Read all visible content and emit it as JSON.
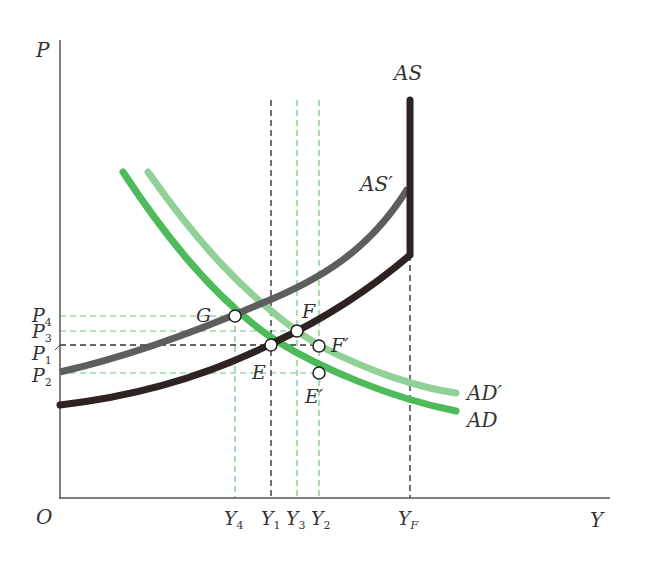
{
  "diagram": {
    "axes": {
      "y_label": "P",
      "x_label": "Y",
      "origin_label": "O"
    },
    "price_levels": [
      {
        "id": "P4",
        "base": "P",
        "sub": "4"
      },
      {
        "id": "P3",
        "base": "P",
        "sub": "3"
      },
      {
        "id": "P1",
        "base": "P",
        "sub": "1"
      },
      {
        "id": "P2",
        "base": "P",
        "sub": "2"
      }
    ],
    "output_levels": [
      {
        "id": "Y4",
        "base": "Y",
        "sub": "4"
      },
      {
        "id": "Y1",
        "base": "Y",
        "sub": "1"
      },
      {
        "id": "Y3",
        "base": "Y",
        "sub": "3"
      },
      {
        "id": "Y2",
        "base": "Y",
        "sub": "2"
      },
      {
        "id": "YF",
        "base": "Y",
        "sub": "F"
      }
    ],
    "curves": {
      "AS": {
        "label": "AS",
        "color": "#2e2222"
      },
      "AS_prime": {
        "label": "AS′",
        "color": "#5e5e5e"
      },
      "AD": {
        "label": "AD",
        "color": "#4dbb5a"
      },
      "AD_prime": {
        "label": "AD′",
        "color": "#8fd197"
      }
    },
    "points": [
      {
        "id": "G",
        "label": "G"
      },
      {
        "id": "F",
        "label": "F"
      },
      {
        "id": "E",
        "label": "E"
      },
      {
        "id": "F_prime",
        "label": "F′"
      },
      {
        "id": "E_prime",
        "label": "E′"
      }
    ],
    "guide_colors": {
      "black_dash": "#333333",
      "green_dash": "#6fc878"
    }
  }
}
